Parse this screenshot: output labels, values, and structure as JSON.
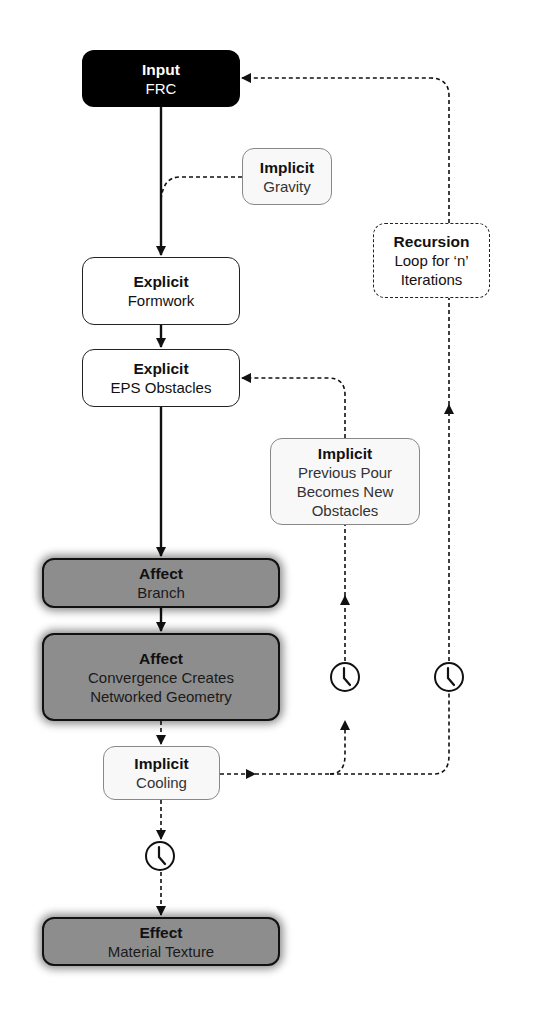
{
  "nodes": {
    "input": {
      "title": "Input",
      "subtitle": "FRC"
    },
    "gravity": {
      "title": "Implicit",
      "subtitle": "Gravity"
    },
    "formwork": {
      "title": "Explicit",
      "subtitle": "Formwork"
    },
    "eps": {
      "title": "Explicit",
      "subtitle": "EPS Obstacles"
    },
    "recursion": {
      "title": "Recursion",
      "line1": "Loop for ‘n’",
      "line2": "Iterations"
    },
    "previous_pour": {
      "title": "Implicit",
      "line1": "Previous Pour",
      "line2": "Becomes New",
      "line3": "Obstacles"
    },
    "branch": {
      "title": "Affect",
      "subtitle": "Branch"
    },
    "convergence": {
      "title": "Affect",
      "line1": "Convergence Creates",
      "line2": "Networked Geometry"
    },
    "cooling": {
      "title": "Implicit",
      "subtitle": "Cooling"
    },
    "effect": {
      "title": "Effect",
      "subtitle": "Material Texture"
    }
  },
  "icons": {
    "time": "clock-icon"
  },
  "colors": {
    "input_fill": "#000000",
    "affect_fill": "#8d8d8d",
    "implicit_fill": "#f8f8f8",
    "line": "#111111"
  }
}
